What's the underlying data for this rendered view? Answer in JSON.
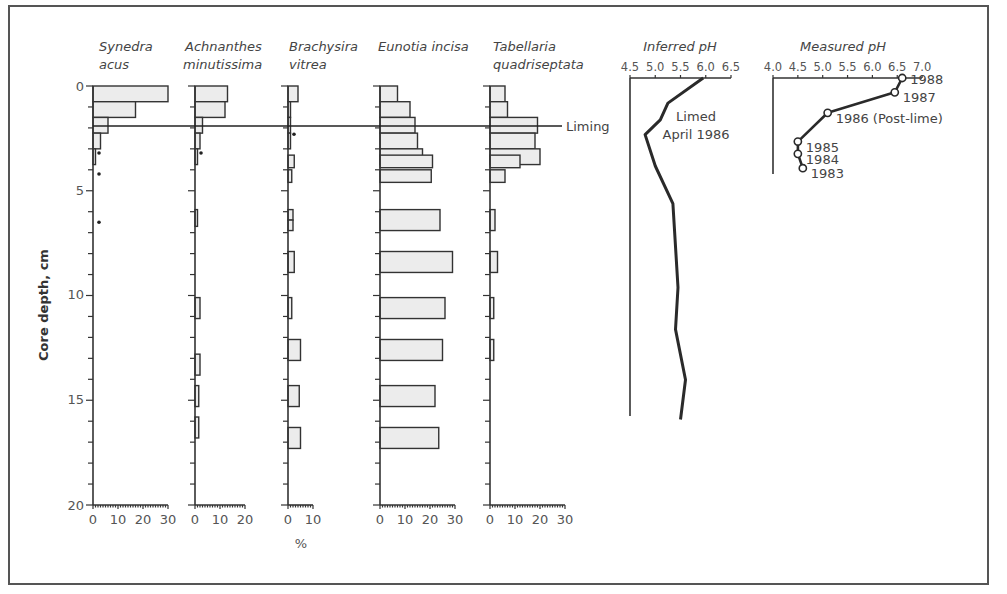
{
  "chart_data": {
    "type": "bar",
    "subtype": "stratigraphic-diagram",
    "ylabel": "Core depth, cm",
    "y_axis": {
      "ticks": [
        0,
        5,
        10,
        15,
        20
      ],
      "range": [
        0,
        20
      ],
      "inverted": true
    },
    "xlabel": "%",
    "liming_line": {
      "label": "Liming",
      "depth_cm": 2.0
    },
    "taxa": [
      {
        "name_line1": "Synedra",
        "name_line2": "acus",
        "xlim": [
          0,
          30
        ],
        "ticks": [
          "0",
          "10",
          "20",
          "30"
        ],
        "bars": [
          {
            "depth": 0.0,
            "thick": 0.75,
            "value": 30
          },
          {
            "depth": 0.75,
            "thick": 0.75,
            "value": 17
          },
          {
            "depth": 1.5,
            "thick": 0.75,
            "value": 6
          },
          {
            "depth": 2.25,
            "thick": 0.75,
            "value": 3
          },
          {
            "depth": 3.0,
            "thick": 0.75,
            "value": 1
          }
        ],
        "presence_dots": [
          3.2,
          4.2,
          6.5
        ]
      },
      {
        "name_line1": "Achnanthes",
        "name_line2": "minutissima",
        "xlim": [
          0,
          20
        ],
        "ticks": [
          "0",
          "10",
          "20"
        ],
        "bars": [
          {
            "depth": 0.0,
            "thick": 0.75,
            "value": 13
          },
          {
            "depth": 0.75,
            "thick": 0.75,
            "value": 12
          },
          {
            "depth": 1.5,
            "thick": 0.75,
            "value": 3
          },
          {
            "depth": 2.25,
            "thick": 0.75,
            "value": 2
          },
          {
            "depth": 3.0,
            "thick": 0.75,
            "value": 0.5
          },
          {
            "depth": 5.9,
            "thick": 0.8,
            "value": 0.5
          },
          {
            "depth": 10.1,
            "thick": 1.0,
            "value": 2
          },
          {
            "depth": 12.8,
            "thick": 1.0,
            "value": 2
          },
          {
            "depth": 14.3,
            "thick": 1.0,
            "value": 1.5
          },
          {
            "depth": 15.8,
            "thick": 1.0,
            "value": 1.5
          }
        ],
        "presence_dots": [
          3.2
        ]
      },
      {
        "name_line1": "Brachysira",
        "name_line2": "vitrea",
        "xlim": [
          0,
          10
        ],
        "ticks": [
          "0",
          "10"
        ],
        "bars": [
          {
            "depth": 0.0,
            "thick": 0.75,
            "value": 4
          },
          {
            "depth": 0.75,
            "thick": 0.75,
            "value": 1
          },
          {
            "depth": 1.5,
            "thick": 0.75,
            "value": 1
          },
          {
            "depth": 2.25,
            "thick": 0.75,
            "value": 1
          },
          {
            "depth": 3.3,
            "thick": 0.6,
            "value": 2.5
          },
          {
            "depth": 4.0,
            "thick": 0.6,
            "value": 1.5
          },
          {
            "depth": 5.9,
            "thick": 0.5,
            "value": 2
          },
          {
            "depth": 6.4,
            "thick": 0.5,
            "value": 2
          },
          {
            "depth": 7.9,
            "thick": 1.0,
            "value": 2.5
          },
          {
            "depth": 10.1,
            "thick": 1.0,
            "value": 1.5
          },
          {
            "depth": 12.1,
            "thick": 1.0,
            "value": 5
          },
          {
            "depth": 14.3,
            "thick": 1.0,
            "value": 4.5
          },
          {
            "depth": 16.3,
            "thick": 1.0,
            "value": 5
          }
        ],
        "presence_dots": [
          2.3
        ]
      },
      {
        "name_line1": "Eunotia incisa",
        "name_line2": "",
        "xlim": [
          0,
          30
        ],
        "ticks": [
          "0",
          "10",
          "20",
          "30"
        ],
        "bars": [
          {
            "depth": 0.0,
            "thick": 0.75,
            "value": 7
          },
          {
            "depth": 0.75,
            "thick": 0.75,
            "value": 12
          },
          {
            "depth": 1.5,
            "thick": 0.75,
            "value": 14
          },
          {
            "depth": 2.25,
            "thick": 0.75,
            "value": 15
          },
          {
            "depth": 3.0,
            "thick": 0.75,
            "value": 17
          },
          {
            "depth": 3.3,
            "thick": 0.6,
            "value": 21
          },
          {
            "depth": 4.0,
            "thick": 0.6,
            "value": 20.5
          },
          {
            "depth": 5.9,
            "thick": 1.0,
            "value": 24
          },
          {
            "depth": 7.9,
            "thick": 1.0,
            "value": 29
          },
          {
            "depth": 10.1,
            "thick": 1.0,
            "value": 26
          },
          {
            "depth": 12.1,
            "thick": 1.0,
            "value": 25
          },
          {
            "depth": 14.3,
            "thick": 1.0,
            "value": 22
          },
          {
            "depth": 16.3,
            "thick": 1.0,
            "value": 23.5
          }
        ],
        "presence_dots": []
      },
      {
        "name_line1": "Tabellaria",
        "name_line2": "quadriseptata",
        "xlim": [
          0,
          30
        ],
        "ticks": [
          "0",
          "10",
          "20",
          "30"
        ],
        "bars": [
          {
            "depth": 0.0,
            "thick": 0.75,
            "value": 6
          },
          {
            "depth": 0.75,
            "thick": 0.75,
            "value": 7
          },
          {
            "depth": 1.5,
            "thick": 0.75,
            "value": 19
          },
          {
            "depth": 2.25,
            "thick": 0.75,
            "value": 18
          },
          {
            "depth": 3.0,
            "thick": 0.75,
            "value": 20
          },
          {
            "depth": 3.3,
            "thick": 0.6,
            "value": 12
          },
          {
            "depth": 4.0,
            "thick": 0.6,
            "value": 6
          },
          {
            "depth": 5.9,
            "thick": 1.0,
            "value": 2
          },
          {
            "depth": 7.9,
            "thick": 1.0,
            "value": 3
          },
          {
            "depth": 10.1,
            "thick": 1.0,
            "value": 1.5
          },
          {
            "depth": 12.1,
            "thick": 1.0,
            "value": 1.5
          }
        ],
        "presence_dots": []
      }
    ],
    "inferred_ph": {
      "title": "Inferred pH",
      "type": "line",
      "xlim": [
        4.5,
        6.5
      ],
      "ticks": [
        "4.5",
        "5.0",
        "5.5",
        "6.0",
        "6.5"
      ],
      "annotation_line1": "Limed",
      "annotation_line2": "April 1986",
      "points": [
        {
          "depth": 0.0,
          "ph": 5.95
        },
        {
          "depth": 1.2,
          "ph": 5.25
        },
        {
          "depth": 2.0,
          "ph": 5.1
        },
        {
          "depth": 2.7,
          "ph": 4.8
        },
        {
          "depth": 4.2,
          "ph": 5.0
        },
        {
          "depth": 6.0,
          "ph": 5.35
        },
        {
          "depth": 10.0,
          "ph": 5.45
        },
        {
          "depth": 12.0,
          "ph": 5.4
        },
        {
          "depth": 14.4,
          "ph": 5.6
        },
        {
          "depth": 16.3,
          "ph": 5.5
        }
      ]
    },
    "measured_ph": {
      "title": "Measured pH",
      "type": "line",
      "xlim": [
        4.0,
        7.0
      ],
      "ticks": [
        "4.0",
        "4.5",
        "5.0",
        "5.5",
        "6.0",
        "6.5",
        "7.0"
      ],
      "points": [
        {
          "label": "1988",
          "ph": 6.6,
          "depth": 0.0
        },
        {
          "label": "1987",
          "ph": 6.45,
          "depth": 0.7
        },
        {
          "label": "1986 (Post-lime)",
          "ph": 5.1,
          "depth": 1.7
        },
        {
          "label": "1985",
          "ph": 4.5,
          "depth": 3.1
        },
        {
          "label": "1984",
          "ph": 4.5,
          "depth": 3.7
        },
        {
          "label": "1983",
          "ph": 4.6,
          "depth": 4.4
        }
      ]
    }
  }
}
